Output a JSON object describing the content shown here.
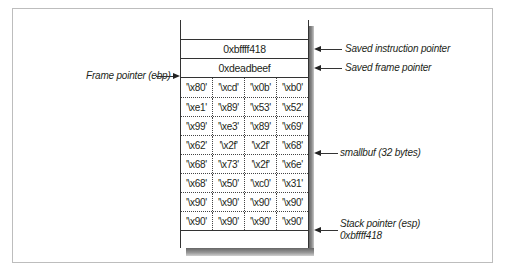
{
  "diagram": {
    "title": "",
    "stack": {
      "top_rows": [
        {
          "value": "0xbffff418"
        },
        {
          "value": "0xdeadbeef"
        }
      ],
      "buffer_rows": [
        [
          "'\\x80'",
          "'\\xcd'",
          "'\\x0b'",
          "'\\xb0'"
        ],
        [
          "'\\xe1'",
          "'\\x89'",
          "'\\x53'",
          "'\\x52'"
        ],
        [
          "'\\x99'",
          "'\\xe3'",
          "'\\x89'",
          "'\\x69'"
        ],
        [
          "'\\x62'",
          "'\\x2f'",
          "'\\x2f'",
          "'\\x68'"
        ],
        [
          "'\\x68'",
          "'\\x73'",
          "'\\x2f'",
          "'\\x6e'"
        ],
        [
          "'\\x68'",
          "'\\x50'",
          "'\\xc0'",
          "'\\x31'"
        ],
        [
          "'\\x90'",
          "'\\x90'",
          "'\\x90'",
          "'\\x90'"
        ],
        [
          "'\\x90'",
          "'\\x90'",
          "'\\x90'",
          "'\\x90'"
        ]
      ]
    },
    "labels": {
      "saved_instruction_pointer": "Saved instruction pointer",
      "saved_frame_pointer": "Saved frame pointer",
      "frame_pointer": "Frame pointer (ebp)",
      "smallbuf": "smallbuf (32 bytes)",
      "stack_pointer": "Stack pointer (esp)",
      "stack_pointer_value": "0xbffff418"
    }
  }
}
